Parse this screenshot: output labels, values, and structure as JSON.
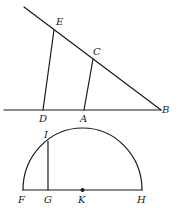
{
  "figure": {
    "labels": {
      "E": "E",
      "C": "C",
      "D": "D",
      "A": "A",
      "B": "B",
      "I": "I",
      "F": "F",
      "G": "G",
      "K": "K",
      "H": "H"
    }
  }
}
